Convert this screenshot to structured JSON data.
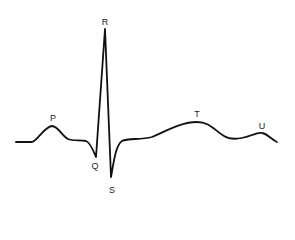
{
  "diagram": {
    "type": "ecg-waveform",
    "stroke_color": "#111111",
    "background": "#ffffff",
    "labels": [
      {
        "id": "p",
        "text": "P",
        "x": 53,
        "y": 118
      },
      {
        "id": "q",
        "text": "Q",
        "x": 95,
        "y": 166
      },
      {
        "id": "r",
        "text": "R",
        "x": 105,
        "y": 22
      },
      {
        "id": "s",
        "text": "S",
        "x": 112,
        "y": 190
      },
      {
        "id": "t",
        "text": "T",
        "x": 197,
        "y": 114
      },
      {
        "id": "u",
        "text": "U",
        "x": 262,
        "y": 126
      }
    ]
  }
}
